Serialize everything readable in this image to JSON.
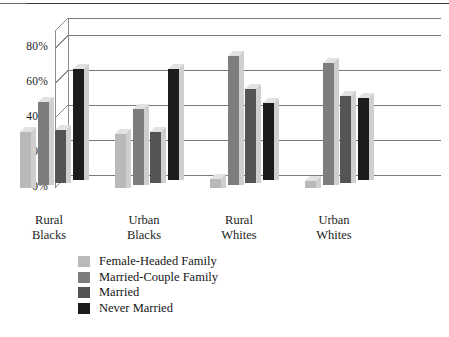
{
  "chart_data": {
    "type": "bar",
    "title": "",
    "subtitle": "",
    "xlabel": "",
    "ylabel": "",
    "ylim": [
      0,
      90
    ],
    "ytick_values": [
      0,
      20,
      40,
      60,
      80
    ],
    "ytick_labels": [
      "0%",
      "20%",
      "40%",
      "60%",
      "80%"
    ],
    "grid": true,
    "grid_axis": "y",
    "legend_position": "below-left",
    "style": "3d-bar",
    "categories": [
      "Rural Blacks",
      "Urban Blacks",
      "Rural Whites",
      "Urban Whites"
    ],
    "category_lines": [
      [
        "Rural",
        "Blacks"
      ],
      [
        "Urban",
        "Blacks"
      ],
      [
        "Rural",
        "Whites"
      ],
      [
        "Urban",
        "Whites"
      ]
    ],
    "series": [
      {
        "name": "Female-Headed Family",
        "color": "#b9b9b9",
        "values": [
          32,
          31,
          5,
          4
        ]
      },
      {
        "name": "Married-Couple Family",
        "color": "#7d7d7d",
        "values": [
          48,
          44,
          74,
          70
        ]
      },
      {
        "name": "Married",
        "color": "#545454",
        "values": [
          30,
          29,
          54,
          50
        ]
      },
      {
        "name": "Never Married",
        "color": "#1c1c1c",
        "values": [
          64,
          64,
          44,
          47
        ]
      }
    ]
  },
  "colors": {
    "axis_line": "#8c8c8c",
    "grid_line": "#7a7a7a",
    "top_rule": "#3a3a3a",
    "bar_side": "#cfcfcf",
    "bar_top": "#e2e2e2",
    "text": "#1a1a1a",
    "background": "#ffffff"
  }
}
